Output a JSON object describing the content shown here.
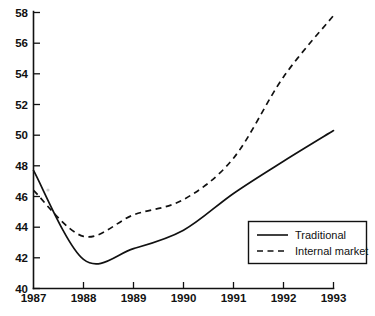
{
  "chart_data": {
    "type": "line",
    "title": "",
    "subtitle": "",
    "xlabel": "",
    "ylabel": "",
    "xlim": [
      1987,
      1993
    ],
    "ylim": [
      40,
      58
    ],
    "grid": false,
    "legend_position": "bottom-right",
    "x_tick_labels": [
      "1987",
      "1988",
      "1989",
      "1990",
      "1991",
      "1992",
      "1993"
    ],
    "y_tick_labels": [
      "40",
      "42",
      "44",
      "46",
      "48",
      "50",
      "52",
      "54",
      "56",
      "58"
    ],
    "x": [
      1987,
      1988,
      1989,
      1990,
      1991,
      1992,
      1993
    ],
    "series": [
      {
        "name": "Traditional",
        "style": "solid",
        "color": "#111111",
        "values": [
          47.7,
          41.9,
          42.6,
          43.8,
          46.2,
          48.3,
          50.3
        ]
      },
      {
        "name": "Internal market",
        "style": "dashed",
        "color": "#111111",
        "values": [
          46.4,
          43.4,
          44.8,
          45.8,
          48.5,
          53.8,
          57.8
        ]
      }
    ],
    "annotations": []
  },
  "legend": {
    "entries": [
      {
        "label": "Traditional",
        "style": "solid"
      },
      {
        "label": "Internal market",
        "style": "dashed"
      }
    ]
  },
  "axes": {
    "y": {
      "ticks": [
        40,
        42,
        44,
        46,
        48,
        50,
        52,
        54,
        56,
        58
      ]
    },
    "x": {
      "ticks": [
        1987,
        1988,
        1989,
        1990,
        1991,
        1992,
        1993
      ]
    }
  }
}
